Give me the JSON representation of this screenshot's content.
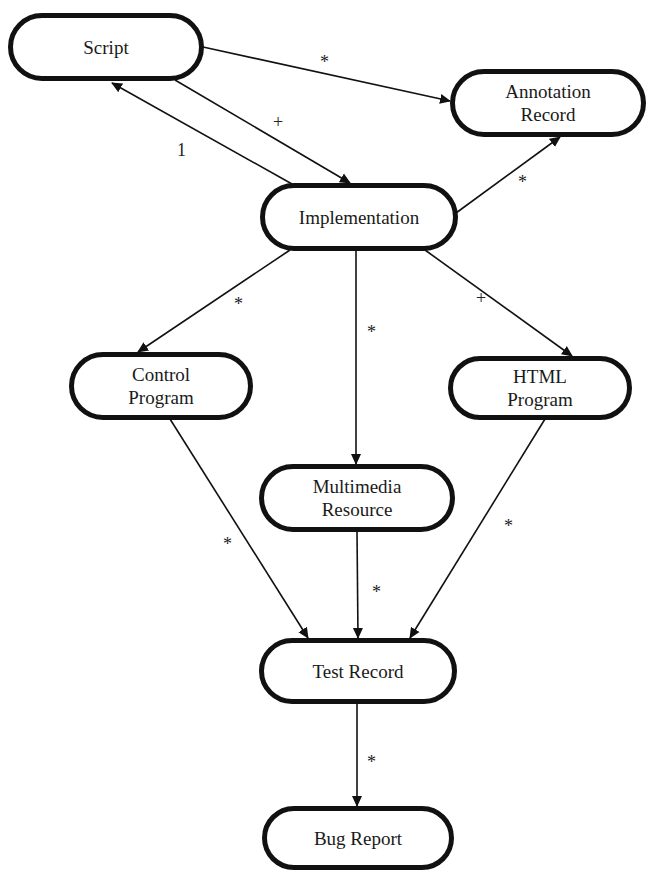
{
  "diagram": {
    "type": "flow",
    "nodes": [
      {
        "id": "script",
        "lines": [
          "Script"
        ]
      },
      {
        "id": "annotation_record",
        "lines": [
          "Annotation",
          "Record"
        ]
      },
      {
        "id": "implementation",
        "lines": [
          "Implementation"
        ]
      },
      {
        "id": "control_program",
        "lines": [
          "Control",
          "Program"
        ]
      },
      {
        "id": "html_program",
        "lines": [
          "HTML",
          "Program"
        ]
      },
      {
        "id": "multimedia_resource",
        "lines": [
          "Multimedia",
          "Resource"
        ]
      },
      {
        "id": "test_record",
        "lines": [
          "Test Record"
        ]
      },
      {
        "id": "bug_report",
        "lines": [
          "Bug Report"
        ]
      }
    ],
    "edges": [
      {
        "from": "script",
        "to": "annotation_record",
        "label": "*"
      },
      {
        "from": "script",
        "to": "implementation",
        "label": "+"
      },
      {
        "from": "implementation",
        "to": "script",
        "label": "1"
      },
      {
        "from": "implementation",
        "to": "annotation_record",
        "label": "*"
      },
      {
        "from": "implementation",
        "to": "control_program",
        "label": "*"
      },
      {
        "from": "implementation",
        "to": "multimedia_resource",
        "label": "*"
      },
      {
        "from": "implementation",
        "to": "html_program",
        "label": "+"
      },
      {
        "from": "control_program",
        "to": "test_record",
        "label": "*"
      },
      {
        "from": "multimedia_resource",
        "to": "test_record",
        "label": "*"
      },
      {
        "from": "html_program",
        "to": "test_record",
        "label": "*"
      },
      {
        "from": "test_record",
        "to": "bug_report",
        "label": "*"
      }
    ]
  }
}
